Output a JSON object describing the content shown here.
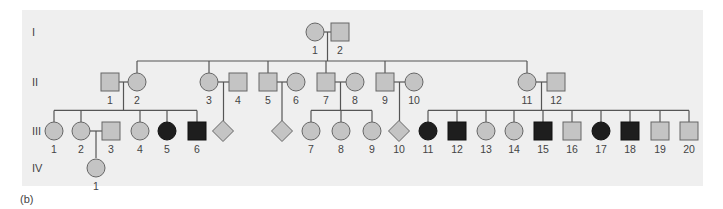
{
  "figure": {
    "caption": "(b)",
    "colors": {
      "panel_bg": "#efefef",
      "unaffected_fill": "#c4c4c4",
      "affected_fill": "#1e1e1e",
      "line": "#555555",
      "label": "#444444"
    },
    "generations": [
      {
        "label": "I",
        "y": 32
      },
      {
        "label": "II",
        "y": 82
      },
      {
        "label": "III",
        "y": 131
      },
      {
        "label": "IV",
        "y": 168
      }
    ]
  },
  "pedigree": {
    "individuals": [
      {
        "id": "I-1",
        "gen": 0,
        "label": "1",
        "sex": "female",
        "affected": false,
        "x": 315
      },
      {
        "id": "I-2",
        "gen": 0,
        "label": "2",
        "sex": "male",
        "affected": false,
        "x": 340
      },
      {
        "id": "II-1",
        "gen": 1,
        "label": "1",
        "sex": "male",
        "affected": false,
        "x": 110
      },
      {
        "id": "II-2",
        "gen": 1,
        "label": "2",
        "sex": "female",
        "affected": false,
        "x": 137
      },
      {
        "id": "II-3",
        "gen": 1,
        "label": "3",
        "sex": "female",
        "affected": false,
        "x": 209
      },
      {
        "id": "II-4",
        "gen": 1,
        "label": "4",
        "sex": "male",
        "affected": false,
        "x": 238
      },
      {
        "id": "II-5",
        "gen": 1,
        "label": "5",
        "sex": "male",
        "affected": false,
        "x": 268
      },
      {
        "id": "II-6",
        "gen": 1,
        "label": "6",
        "sex": "female",
        "affected": false,
        "x": 296
      },
      {
        "id": "II-7",
        "gen": 1,
        "label": "7",
        "sex": "male",
        "affected": false,
        "x": 326
      },
      {
        "id": "II-8",
        "gen": 1,
        "label": "8",
        "sex": "female",
        "affected": false,
        "x": 355
      },
      {
        "id": "II-9",
        "gen": 1,
        "label": "9",
        "sex": "male",
        "affected": false,
        "x": 385
      },
      {
        "id": "II-10",
        "gen": 1,
        "label": "10",
        "sex": "female",
        "affected": false,
        "x": 414
      },
      {
        "id": "II-11",
        "gen": 1,
        "label": "11",
        "sex": "female",
        "affected": false,
        "x": 527
      },
      {
        "id": "II-12",
        "gen": 1,
        "label": "12",
        "sex": "male",
        "affected": false,
        "x": 556
      },
      {
        "id": "III-1",
        "gen": 2,
        "label": "1",
        "sex": "female",
        "affected": false,
        "x": 54
      },
      {
        "id": "III-2",
        "gen": 2,
        "label": "2",
        "sex": "female",
        "affected": false,
        "x": 81
      },
      {
        "id": "III-3",
        "gen": 2,
        "label": "3",
        "sex": "male",
        "affected": false,
        "x": 111
      },
      {
        "id": "III-4",
        "gen": 2,
        "label": "4",
        "sex": "female",
        "affected": false,
        "x": 140
      },
      {
        "id": "III-5",
        "gen": 2,
        "label": "5",
        "sex": "female",
        "affected": true,
        "x": 167
      },
      {
        "id": "III-6",
        "gen": 2,
        "label": "6",
        "sex": "male",
        "affected": true,
        "x": 197
      },
      {
        "id": "III-u1",
        "gen": 2,
        "label": "",
        "sex": "unknown",
        "affected": false,
        "x": 223
      },
      {
        "id": "III-u2",
        "gen": 2,
        "label": "",
        "sex": "unknown",
        "affected": false,
        "x": 282
      },
      {
        "id": "III-7",
        "gen": 2,
        "label": "7",
        "sex": "female",
        "affected": false,
        "x": 311
      },
      {
        "id": "III-8",
        "gen": 2,
        "label": "8",
        "sex": "female",
        "affected": false,
        "x": 341
      },
      {
        "id": "III-9",
        "gen": 2,
        "label": "9",
        "sex": "female",
        "affected": false,
        "x": 372
      },
      {
        "id": "III-10",
        "gen": 2,
        "label": "10",
        "sex": "unknown",
        "affected": false,
        "x": 399
      },
      {
        "id": "III-11",
        "gen": 2,
        "label": "11",
        "sex": "female",
        "affected": true,
        "x": 428
      },
      {
        "id": "III-12",
        "gen": 2,
        "label": "12",
        "sex": "male",
        "affected": true,
        "x": 457
      },
      {
        "id": "III-13",
        "gen": 2,
        "label": "13",
        "sex": "female",
        "affected": false,
        "x": 486
      },
      {
        "id": "III-14",
        "gen": 2,
        "label": "14",
        "sex": "female",
        "affected": false,
        "x": 514
      },
      {
        "id": "III-15",
        "gen": 2,
        "label": "15",
        "sex": "male",
        "affected": true,
        "x": 543
      },
      {
        "id": "III-16",
        "gen": 2,
        "label": "16",
        "sex": "male",
        "affected": false,
        "x": 572
      },
      {
        "id": "III-17",
        "gen": 2,
        "label": "17",
        "sex": "female",
        "affected": true,
        "x": 601
      },
      {
        "id": "III-18",
        "gen": 2,
        "label": "18",
        "sex": "male",
        "affected": true,
        "x": 630
      },
      {
        "id": "III-19",
        "gen": 2,
        "label": "19",
        "sex": "male",
        "affected": false,
        "x": 660
      },
      {
        "id": "III-20",
        "gen": 2,
        "label": "20",
        "sex": "male",
        "affected": false,
        "x": 689
      },
      {
        "id": "IV-1",
        "gen": 3,
        "label": "1",
        "sex": "female",
        "affected": false,
        "x": 96
      }
    ],
    "matings": [
      {
        "a": "I-1",
        "b": "I-2",
        "children": [
          "II-2",
          "II-3",
          "II-5",
          "II-7",
          "II-9",
          "II-11"
        ]
      },
      {
        "a": "II-1",
        "b": "II-2",
        "children": [
          "III-1",
          "III-2",
          "III-4",
          "III-5",
          "III-6"
        ]
      },
      {
        "a": "II-3",
        "b": "II-4",
        "children": [
          "III-u1"
        ]
      },
      {
        "a": "II-5",
        "b": "II-6",
        "children": [
          "III-u2"
        ]
      },
      {
        "a": "II-7",
        "b": "II-8",
        "children": [
          "III-7",
          "III-8",
          "III-9"
        ]
      },
      {
        "a": "II-9",
        "b": "II-10",
        "children": [
          "III-10"
        ]
      },
      {
        "a": "II-11",
        "b": "II-12",
        "children": [
          "III-11",
          "III-12",
          "III-13",
          "III-14",
          "III-15",
          "III-16",
          "III-17",
          "III-18",
          "III-19",
          "III-20"
        ]
      },
      {
        "a": "III-2",
        "b": "III-3",
        "children": [
          "IV-1"
        ]
      }
    ]
  }
}
